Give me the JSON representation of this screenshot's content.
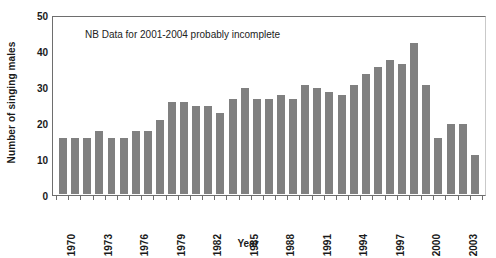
{
  "chart_data": {
    "type": "bar",
    "title": "",
    "xlabel": "Year",
    "ylabel": "Number of singing males",
    "ylim": [
      0,
      50
    ],
    "yticks": [
      0,
      10,
      20,
      30,
      40,
      50
    ],
    "grid": false,
    "legend": null,
    "bar_color": "#808080",
    "annotations": [
      {
        "text": "NB Data for 2001-2004 probably incomplete",
        "x": 1973,
        "y": 45
      }
    ],
    "categories": [
      "1970",
      "1971",
      "1972",
      "1973",
      "1974",
      "1975",
      "1976",
      "1977",
      "1978",
      "1979",
      "1980",
      "1981",
      "1982",
      "1983",
      "1984",
      "1985",
      "1986",
      "1987",
      "1988",
      "1989",
      "1990",
      "1991",
      "1992",
      "1993",
      "1994",
      "1995",
      "1996",
      "1997",
      "1998",
      "1999",
      "2000",
      "2001",
      "2002",
      "2003",
      "2004"
    ],
    "values": [
      16,
      16,
      16,
      18,
      16,
      16,
      18,
      18,
      21,
      26,
      26,
      25,
      25,
      23,
      27,
      30,
      27,
      27,
      28,
      27,
      31,
      30,
      29,
      28,
      31,
      34,
      36,
      38,
      37,
      43,
      31,
      16,
      20,
      20,
      11
    ],
    "xtick_labels": [
      "1970",
      "1973",
      "1976",
      "1979",
      "1982",
      "1985",
      "1988",
      "1991",
      "1994",
      "1997",
      "2000",
      "2003"
    ],
    "xtick_indices": [
      0,
      3,
      6,
      9,
      12,
      15,
      18,
      21,
      24,
      27,
      30,
      33
    ]
  }
}
